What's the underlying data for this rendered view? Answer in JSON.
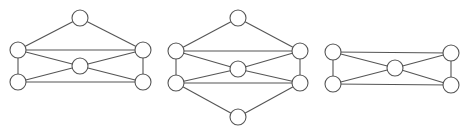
{
  "style": {
    "stroke": "#555555",
    "fill": "#ffffff",
    "node_radius": 8
  },
  "graphs": [
    {
      "id": "graph-1",
      "nodes": [
        {
          "id": "top",
          "x": 80,
          "y": 18
        },
        {
          "id": "left-upper",
          "x": 18,
          "y": 50
        },
        {
          "id": "right-upper",
          "x": 143,
          "y": 50
        },
        {
          "id": "center",
          "x": 80,
          "y": 66
        },
        {
          "id": "left-lower",
          "x": 18,
          "y": 82
        },
        {
          "id": "right-lower",
          "x": 143,
          "y": 82
        }
      ],
      "edges": [
        [
          "top",
          "left-upper"
        ],
        [
          "top",
          "right-upper"
        ],
        [
          "left-upper",
          "right-upper"
        ],
        [
          "left-upper",
          "left-lower"
        ],
        [
          "right-upper",
          "right-lower"
        ],
        [
          "left-upper",
          "center"
        ],
        [
          "right-upper",
          "center"
        ],
        [
          "left-lower",
          "center"
        ],
        [
          "right-lower",
          "center"
        ],
        [
          "left-lower",
          "right-lower"
        ]
      ]
    },
    {
      "id": "graph-2",
      "nodes": [
        {
          "id": "top",
          "x": 238,
          "y": 18
        },
        {
          "id": "left-upper",
          "x": 176,
          "y": 51
        },
        {
          "id": "right-upper",
          "x": 300,
          "y": 51
        },
        {
          "id": "center",
          "x": 238,
          "y": 69
        },
        {
          "id": "left-lower",
          "x": 176,
          "y": 83
        },
        {
          "id": "right-lower",
          "x": 300,
          "y": 83
        },
        {
          "id": "bottom",
          "x": 238,
          "y": 117
        }
      ],
      "edges": [
        [
          "top",
          "left-upper"
        ],
        [
          "top",
          "right-upper"
        ],
        [
          "left-upper",
          "right-upper"
        ],
        [
          "left-upper",
          "left-lower"
        ],
        [
          "right-upper",
          "right-lower"
        ],
        [
          "left-upper",
          "center"
        ],
        [
          "right-upper",
          "center"
        ],
        [
          "left-lower",
          "center"
        ],
        [
          "right-lower",
          "center"
        ],
        [
          "left-lower",
          "right-lower"
        ],
        [
          "left-lower",
          "bottom"
        ],
        [
          "right-lower",
          "bottom"
        ]
      ]
    },
    {
      "id": "graph-3",
      "nodes": [
        {
          "id": "left-upper",
          "x": 333,
          "y": 52
        },
        {
          "id": "right-upper",
          "x": 451,
          "y": 53
        },
        {
          "id": "center",
          "x": 395,
          "y": 68
        },
        {
          "id": "left-lower",
          "x": 333,
          "y": 84
        },
        {
          "id": "right-lower",
          "x": 451,
          "y": 85
        }
      ],
      "edges": [
        [
          "left-upper",
          "right-upper"
        ],
        [
          "left-upper",
          "left-lower"
        ],
        [
          "right-upper",
          "right-lower"
        ],
        [
          "left-upper",
          "center"
        ],
        [
          "right-upper",
          "center"
        ],
        [
          "left-lower",
          "center"
        ],
        [
          "right-lower",
          "center"
        ],
        [
          "left-lower",
          "right-lower"
        ]
      ]
    }
  ]
}
